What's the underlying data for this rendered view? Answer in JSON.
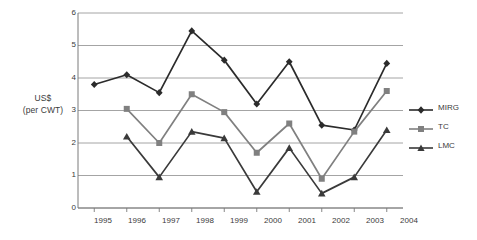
{
  "chart_data": {
    "type": "line",
    "title": "",
    "xlabel": "",
    "ylabel": "US$ (per CWT)",
    "ylabel_line1": "US$",
    "ylabel_line2": "(per CWT)",
    "categories": [
      "1995",
      "1996",
      "1997",
      "1998",
      "1999",
      "2000",
      "2001",
      "2002",
      "2003",
      "2004"
    ],
    "ylim": [
      0,
      6
    ],
    "yticks": [
      "6",
      "5",
      "4",
      "3",
      "2",
      "1",
      "0"
    ],
    "ytick_values": [
      6,
      5,
      4,
      3,
      2,
      1,
      0
    ],
    "grid": "horizontal",
    "legend_position": "right",
    "series": [
      {
        "name": "MIRG",
        "marker": "diamond",
        "color": "#2b2b2b",
        "values": [
          3.8,
          4.1,
          3.55,
          5.45,
          4.55,
          3.2,
          4.5,
          2.55,
          2.4,
          4.45
        ]
      },
      {
        "name": "TC",
        "marker": "square",
        "color": "#808080",
        "values": [
          null,
          3.05,
          2.0,
          3.5,
          2.95,
          1.7,
          2.6,
          0.9,
          2.35,
          3.6
        ]
      },
      {
        "name": "LMC",
        "marker": "triangle",
        "color": "#3a3a3a",
        "values": [
          null,
          2.2,
          0.95,
          2.35,
          2.15,
          0.5,
          1.85,
          0.45,
          0.95,
          2.4
        ]
      }
    ]
  },
  "legend": {
    "items": [
      {
        "label": "MIRG"
      },
      {
        "label": "TC"
      },
      {
        "label": "LMC"
      }
    ]
  },
  "colors": {
    "mirg": "#2b2b2b",
    "tc": "#808080",
    "lmc": "#3a3a3a",
    "grid": "#9a9a9a",
    "axis": "#7a7a7a",
    "text": "#3b3b3b"
  }
}
